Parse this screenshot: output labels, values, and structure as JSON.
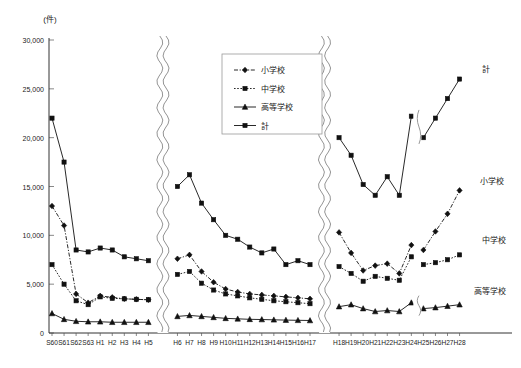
{
  "chart_data": {
    "type": "line",
    "title": "",
    "unit_label": "(件)",
    "xlabel": "",
    "ylabel": "",
    "ylim": [
      0,
      30000
    ],
    "ytick_labels": [
      "0",
      "5,000",
      "10,000",
      "15,000",
      "20,000",
      "25,000",
      "30,000"
    ],
    "ytick_values": [
      0,
      5000,
      10000,
      15000,
      20000,
      25000,
      30000
    ],
    "grid": false,
    "legend_position": "top-center",
    "axis_breaks": [
      "between H5 and H6",
      "between H17 and H18"
    ],
    "series_breaks": [
      "between H24 and H25"
    ],
    "categories": [
      "S60",
      "S61",
      "S62",
      "S63",
      "H1",
      "H2",
      "H3",
      "H4",
      "H5",
      "H6",
      "H7",
      "H8",
      "H9",
      "H10",
      "H11",
      "H12",
      "H13",
      "H14",
      "H15",
      "H16",
      "H17",
      "H18",
      "H19",
      "H20",
      "H21",
      "H22",
      "H23",
      "H24",
      "H25",
      "H26",
      "H27",
      "H28"
    ],
    "segments": [
      {
        "name": "segment-1",
        "categories": [
          "S60",
          "S61",
          "S62",
          "S63",
          "H1",
          "H2",
          "H3",
          "H4",
          "H5"
        ]
      },
      {
        "name": "segment-2",
        "categories": [
          "H6",
          "H7",
          "H8",
          "H9",
          "H10",
          "H11",
          "H12",
          "H13",
          "H14",
          "H15",
          "H16",
          "H17"
        ]
      },
      {
        "name": "segment-3a",
        "categories": [
          "H18",
          "H19",
          "H20",
          "H21",
          "H22",
          "H23",
          "H24"
        ]
      },
      {
        "name": "segment-3b",
        "categories": [
          "H25",
          "H26",
          "H27",
          "H28"
        ]
      }
    ],
    "series": [
      {
        "name": "小学校",
        "key": "elementary",
        "marker": "diamond",
        "line_style": "dash-dot",
        "values": [
          13000,
          11000,
          4000,
          3100,
          3800,
          3650,
          3500,
          3450,
          3400,
          7600,
          8000,
          6300,
          5200,
          4500,
          4200,
          4000,
          3900,
          3800,
          3700,
          3600,
          3500,
          10300,
          8200,
          6400,
          6900,
          7100,
          6100,
          9000,
          8500,
          10400,
          12200,
          14600
        ],
        "right_label": "小学校"
      },
      {
        "name": "中学校",
        "key": "junior_high",
        "marker": "square",
        "line_style": "dotted",
        "values": [
          7000,
          5000,
          3300,
          2900,
          3700,
          3550,
          3500,
          3450,
          3400,
          6000,
          6300,
          5100,
          4400,
          4000,
          3800,
          3600,
          3450,
          3300,
          3200,
          3100,
          3000,
          6800,
          6100,
          5300,
          5800,
          5600,
          5400,
          7800,
          7000,
          7200,
          7500,
          8000
        ],
        "right_label": "中学校"
      },
      {
        "name": "高等学校",
        "key": "high_school",
        "marker": "triangle",
        "line_style": "solid",
        "values": [
          2000,
          1400,
          1200,
          1150,
          1150,
          1100,
          1100,
          1100,
          1100,
          1700,
          1800,
          1700,
          1600,
          1500,
          1450,
          1400,
          1380,
          1350,
          1320,
          1300,
          1280,
          2700,
          2900,
          2500,
          2200,
          2300,
          2200,
          3100,
          2500,
          2600,
          2750,
          2900
        ],
        "right_label": "高等学校"
      },
      {
        "name": "計",
        "key": "total",
        "marker": "square",
        "line_style": "solid",
        "values": [
          22000,
          17500,
          8500,
          8300,
          8700,
          8500,
          7800,
          7600,
          7400,
          15000,
          16200,
          13300,
          11600,
          10000,
          9600,
          8800,
          8200,
          8600,
          7000,
          7400,
          7000,
          20000,
          18200,
          15200,
          14100,
          16000,
          14100,
          22200,
          20000,
          22000,
          24000,
          26000
        ],
        "right_label": "計"
      }
    ],
    "legend": [
      {
        "label": "小学校",
        "marker": "diamond",
        "line_style": "dash-dot"
      },
      {
        "label": "中学校",
        "marker": "square",
        "line_style": "dotted"
      },
      {
        "label": "高等学校",
        "marker": "triangle",
        "line_style": "solid"
      },
      {
        "label": "計",
        "marker": "square",
        "line_style": "solid"
      }
    ]
  }
}
